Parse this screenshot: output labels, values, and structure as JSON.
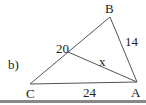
{
  "problem_label": "b)",
  "vertices": {
    "A": {
      "label": "A",
      "x": 137,
      "y": 82
    },
    "B": {
      "label": "B",
      "x": 110,
      "y": 17
    },
    "C": {
      "label": "C",
      "x": 30,
      "y": 84
    },
    "D": {
      "x": 68,
      "y": 52
    }
  },
  "segment_labels": {
    "CB_part": "20",
    "BA": "14",
    "CA": "24",
    "DA": "x"
  },
  "colors": {
    "line": "#555555",
    "text": "#222222",
    "rule": "#888888"
  }
}
